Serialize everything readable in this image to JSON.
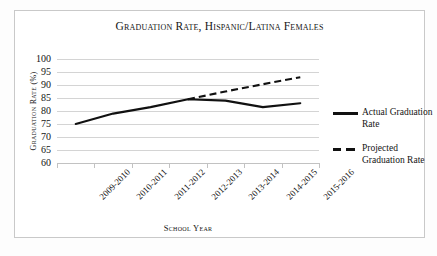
{
  "chart_data": {
    "type": "line",
    "title": "Graduation Rate, Hispanic/Latina Females",
    "xlabel": "School Year",
    "ylabel": "Graduation Rate (%)",
    "categories": [
      "2009-2010",
      "2010-2011",
      "2011-2012",
      "2012-2013",
      "2013-2014",
      "2014-2015",
      "2015-2016"
    ],
    "ylim": [
      60,
      100
    ],
    "ytick_labels": [
      "100",
      "95",
      "90",
      "85",
      "80",
      "75",
      "70",
      "65",
      "60"
    ],
    "yticks": [
      100,
      95,
      90,
      85,
      80,
      75,
      70,
      65,
      60
    ],
    "grid": true,
    "legend_position": "right",
    "series": [
      {
        "name": "Actual Graduation Rate",
        "style": "solid",
        "color": "#111111",
        "values": [
          75,
          79,
          81.5,
          84.5,
          84,
          81.5,
          83
        ]
      },
      {
        "name": "Projected Graduation Rate",
        "style": "dashed",
        "color": "#111111",
        "values": [
          null,
          null,
          null,
          84.5,
          87.5,
          90.3,
          93
        ]
      }
    ]
  },
  "legend": {
    "entries": [
      {
        "label": "Actual Graduation Rate",
        "style": "solid"
      },
      {
        "label": "Projected Graduation Rate",
        "style": "dashed"
      }
    ]
  }
}
